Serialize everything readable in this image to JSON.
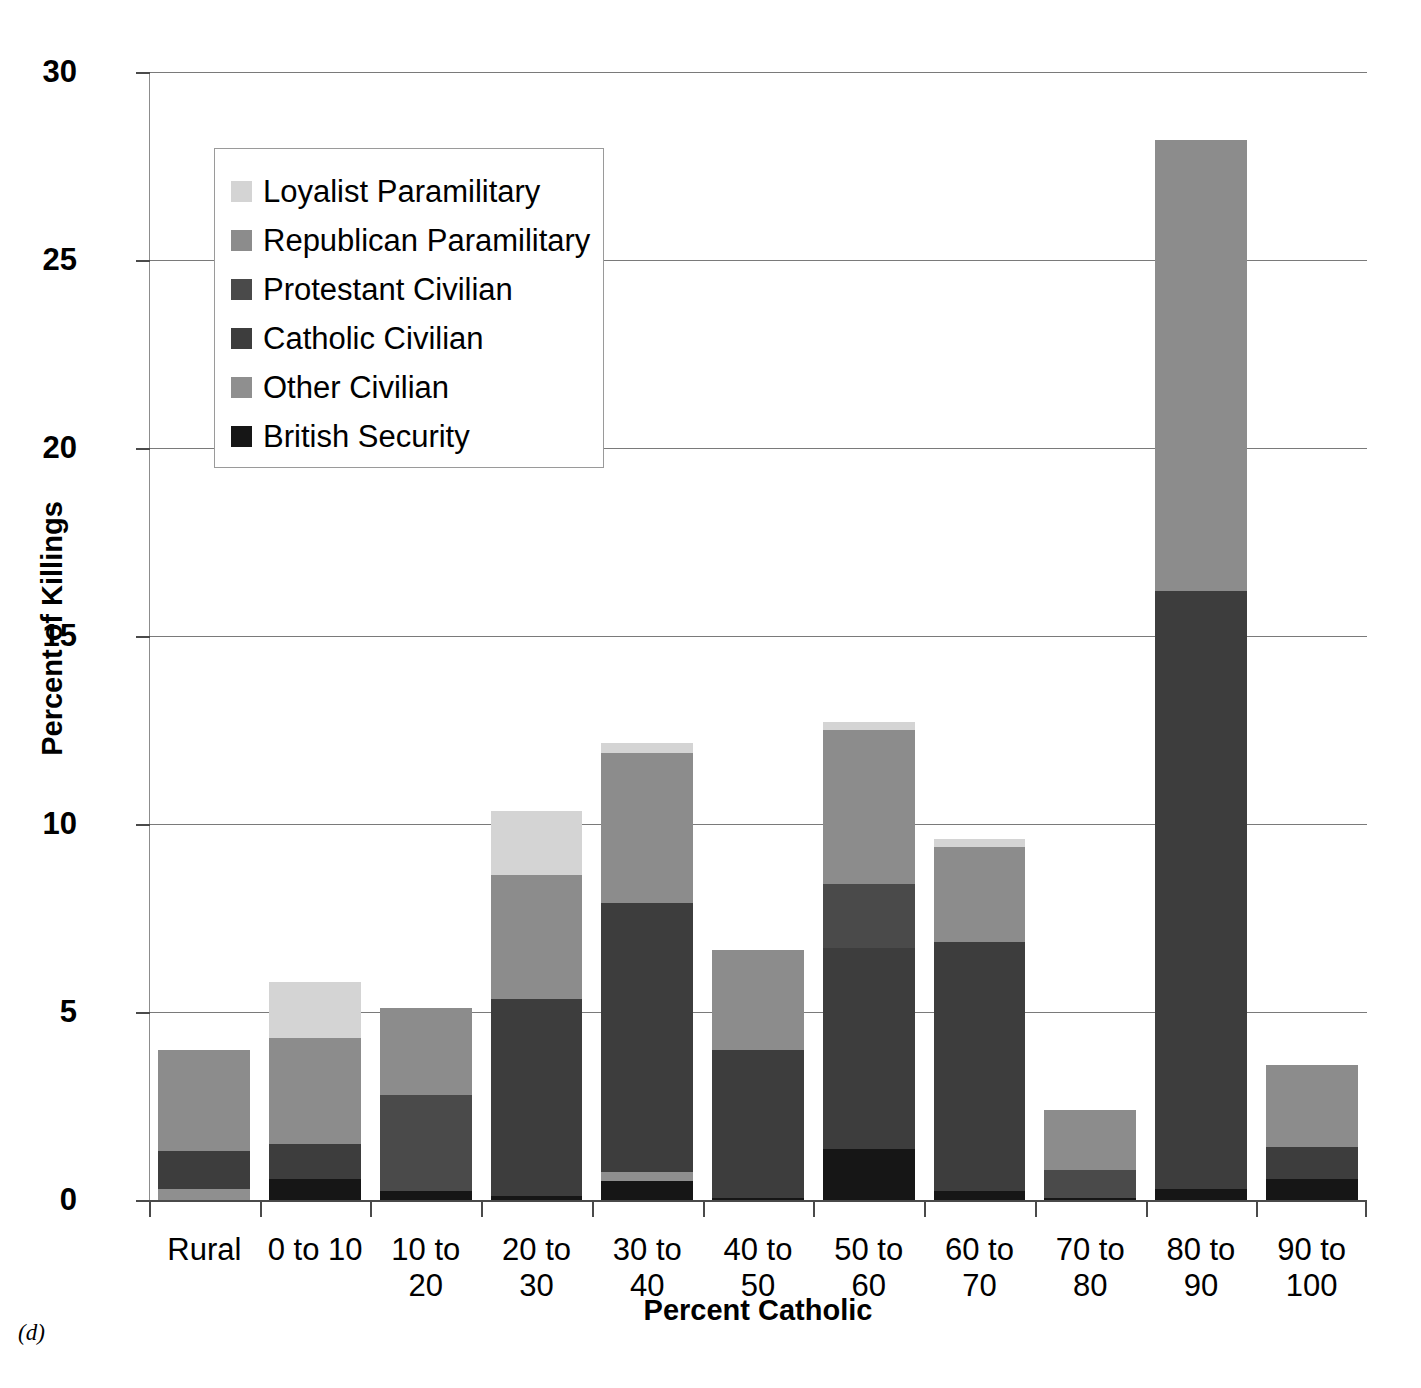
{
  "figure": {
    "caption": "(d)"
  },
  "axes": {
    "y_title": "Percent of Killings",
    "x_title": "Percent Catholic",
    "y_ticks": [
      "30",
      "25",
      "20",
      "15",
      "10",
      "5",
      "0"
    ]
  },
  "legend": {
    "items": [
      {
        "label": "Loyalist Paramilitary",
        "color": "#d4d4d4"
      },
      {
        "label": "Republican Paramilitary",
        "color": "#8c8c8c"
      },
      {
        "label": "Protestant Civilian",
        "color": "#4a4a4a"
      },
      {
        "label": "Catholic Civilian",
        "color": "#3d3d3d"
      },
      {
        "label": "Other Civilian",
        "color": "#8f8f8f"
      },
      {
        "label": "British Security",
        "color": "#161616"
      }
    ]
  },
  "chart_data": {
    "type": "bar",
    "subtype": "stacked-vertical",
    "title": "",
    "xlabel": "Percent Catholic",
    "ylabel": "Percent of Killings",
    "ylim": [
      0,
      30
    ],
    "ytick_step": 5,
    "grid": "horizontal",
    "legend_position": "inside-top-left",
    "categories": [
      "Rural",
      "0 to 10",
      "10 to 20",
      "20 to 30",
      "30 to 40",
      "40 to 50",
      "50 to 60",
      "60 to 70",
      "70 to 80",
      "80 to 90",
      "90 to 100"
    ],
    "series": [
      {
        "name": "British Security",
        "color": "#161616",
        "values": [
          0.0,
          0.55,
          0.25,
          0.1,
          0.5,
          0.05,
          1.35,
          0.25,
          0.05,
          0.3,
          0.55
        ]
      },
      {
        "name": "Other Civilian",
        "color": "#8f8f8f",
        "values": [
          0.3,
          0.0,
          0.0,
          0.0,
          0.25,
          0.0,
          0.0,
          0.0,
          0.0,
          0.0,
          0.0
        ]
      },
      {
        "name": "Catholic Civilian",
        "color": "#3d3d3d",
        "values": [
          1.0,
          0.95,
          0.0,
          5.25,
          7.15,
          3.95,
          5.35,
          6.6,
          0.0,
          15.9,
          0.85
        ]
      },
      {
        "name": "Protestant Civilian",
        "color": "#4a4a4a",
        "values": [
          0.0,
          0.0,
          2.55,
          0.0,
          0.0,
          0.0,
          1.7,
          0.0,
          0.75,
          0.0,
          0.0
        ]
      },
      {
        "name": "Republican Paramilitary",
        "color": "#8c8c8c",
        "values": [
          2.7,
          2.8,
          2.3,
          3.3,
          4.0,
          2.65,
          4.1,
          2.55,
          1.6,
          12.0,
          2.2
        ]
      },
      {
        "name": "Loyalist Paramilitary",
        "color": "#d4d4d4",
        "values": [
          0.0,
          1.5,
          0.0,
          1.7,
          0.25,
          0.0,
          0.2,
          0.2,
          0.0,
          0.0,
          0.0
        ]
      }
    ],
    "totals": [
      4.0,
      5.8,
      5.1,
      10.35,
      12.15,
      6.65,
      12.7,
      9.6,
      2.4,
      28.2,
      3.6
    ]
  }
}
